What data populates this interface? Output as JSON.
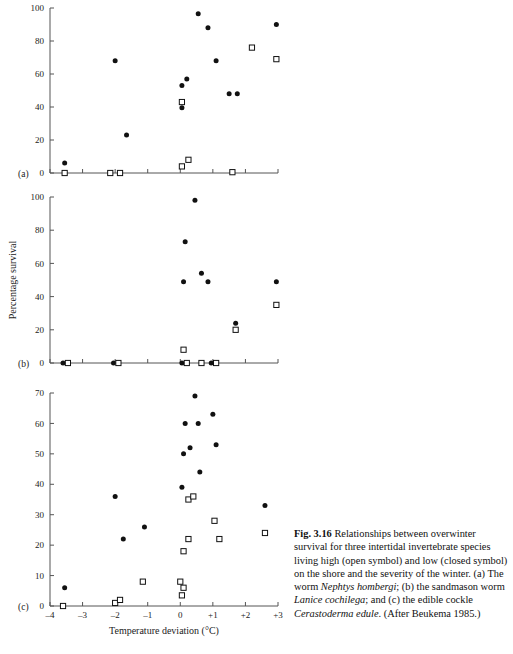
{
  "figure": {
    "label": "Fig. 3.16",
    "xlabel": "Temperature deviation (°C)",
    "ylabel": "Percentage survival",
    "panel_letters": [
      "(a)",
      "(b)",
      "(c)"
    ],
    "x_ticks": [
      "–4",
      "–3",
      "–2",
      "–1",
      "0",
      "+1",
      "+2",
      "+3"
    ],
    "x_tick_values": [
      -4,
      -3,
      -2,
      -1,
      0,
      1,
      2,
      3
    ]
  },
  "caption": {
    "label": "Fig. 3.16",
    "part1": "Relationships between overwinter survival for three intertidal invertebrate species living high (open symbol) and low (closed symbol) on the shore and the severity of the winter. (a) The worm ",
    "species_a": "Nephtys hombergi",
    "part2": "; (b) the sandmason worm ",
    "species_b": "Lanice cochilega",
    "part3": "; and (c) the edible cockle ",
    "species_c": "Cerastoderma edule",
    "part4": ". (After Beukema 1985.)"
  },
  "chart_data": [
    {
      "type": "scatter",
      "panel": "(a)",
      "title": "Nephtys hombergi",
      "xlabel": "Temperature deviation (°C)",
      "ylabel": "Percentage survival",
      "xlim": [
        -4,
        3
      ],
      "ylim": [
        0,
        100
      ],
      "yticks": [
        0,
        20,
        40,
        60,
        80,
        100
      ],
      "xticks": [
        -4,
        -3,
        -2,
        -1,
        0,
        1,
        2,
        3
      ],
      "grid": false,
      "legend": [
        "low on shore (closed symbol)",
        "high on shore (open symbol)"
      ],
      "series": [
        {
          "name": "low shore (closed)",
          "marker": "closed-circle",
          "points": [
            [
              -3.55,
              6
            ],
            [
              -2.0,
              68
            ],
            [
              -1.65,
              23
            ],
            [
              0.05,
              53
            ],
            [
              0.2,
              57
            ],
            [
              0.05,
              39.5
            ],
            [
              0.55,
              96.5
            ],
            [
              0.85,
              88
            ],
            [
              1.1,
              68
            ],
            [
              1.5,
              48
            ],
            [
              1.75,
              48
            ],
            [
              2.95,
              90
            ]
          ]
        },
        {
          "name": "high shore (open)",
          "marker": "open-square",
          "points": [
            [
              -3.55,
              0
            ],
            [
              -2.15,
              0
            ],
            [
              -1.85,
              0
            ],
            [
              0.05,
              4
            ],
            [
              0.25,
              8
            ],
            [
              0.05,
              43
            ],
            [
              1.6,
              0.5
            ],
            [
              2.2,
              76
            ],
            [
              2.95,
              69
            ]
          ]
        }
      ]
    },
    {
      "type": "scatter",
      "panel": "(b)",
      "title": "Lanice cochilega",
      "xlabel": "Temperature deviation (°C)",
      "ylabel": "Percentage survival",
      "xlim": [
        -4,
        3
      ],
      "ylim": [
        0,
        100
      ],
      "yticks": [
        0,
        20,
        40,
        60,
        80,
        100
      ],
      "xticks": [
        -4,
        -3,
        -2,
        -1,
        0,
        1,
        2,
        3
      ],
      "grid": false,
      "series": [
        {
          "name": "low shore (closed)",
          "marker": "closed-circle",
          "points": [
            [
              -3.6,
              0
            ],
            [
              -2.05,
              0
            ],
            [
              0.05,
              0
            ],
            [
              0.95,
              0
            ],
            [
              0.1,
              49
            ],
            [
              0.15,
              73
            ],
            [
              0.45,
              98
            ],
            [
              0.65,
              54
            ],
            [
              0.85,
              49
            ],
            [
              1.7,
              24
            ],
            [
              2.95,
              49
            ]
          ]
        },
        {
          "name": "high shore (open)",
          "marker": "open-square",
          "points": [
            [
              -3.45,
              0
            ],
            [
              -1.9,
              0
            ],
            [
              0.2,
              0
            ],
            [
              0.65,
              0
            ],
            [
              1.1,
              0
            ],
            [
              0.1,
              8
            ],
            [
              1.7,
              20
            ],
            [
              2.95,
              35
            ]
          ]
        }
      ]
    },
    {
      "type": "scatter",
      "panel": "(c)",
      "title": "Cerastoderma edule",
      "xlabel": "Temperature deviation (°C)",
      "ylabel": "Percentage survival",
      "xlim": [
        -4,
        3
      ],
      "ylim": [
        0,
        70
      ],
      "yticks": [
        0,
        10,
        20,
        30,
        40,
        50,
        60,
        70
      ],
      "xticks": [
        -4,
        -3,
        -2,
        -1,
        0,
        1,
        2,
        3
      ],
      "grid": false,
      "series": [
        {
          "name": "low shore (closed)",
          "marker": "closed-circle",
          "points": [
            [
              -3.55,
              6
            ],
            [
              -2.0,
              36
            ],
            [
              -1.75,
              22
            ],
            [
              -1.1,
              26
            ],
            [
              0.05,
              39
            ],
            [
              0.1,
              50
            ],
            [
              0.15,
              60
            ],
            [
              0.3,
              52
            ],
            [
              0.45,
              69
            ],
            [
              0.55,
              60
            ],
            [
              0.6,
              44
            ],
            [
              1.0,
              63
            ],
            [
              1.1,
              53
            ],
            [
              2.6,
              33
            ]
          ]
        },
        {
          "name": "high shore (open)",
          "marker": "open-square",
          "points": [
            [
              -3.6,
              0
            ],
            [
              -2.0,
              1
            ],
            [
              -1.85,
              2
            ],
            [
              -1.15,
              8
            ],
            [
              0.0,
              8
            ],
            [
              0.1,
              6
            ],
            [
              0.05,
              3.5
            ],
            [
              0.1,
              18
            ],
            [
              0.25,
              22
            ],
            [
              0.25,
              35
            ],
            [
              0.4,
              36
            ],
            [
              1.05,
              28
            ],
            [
              1.2,
              22
            ],
            [
              2.6,
              24
            ]
          ]
        }
      ]
    }
  ]
}
